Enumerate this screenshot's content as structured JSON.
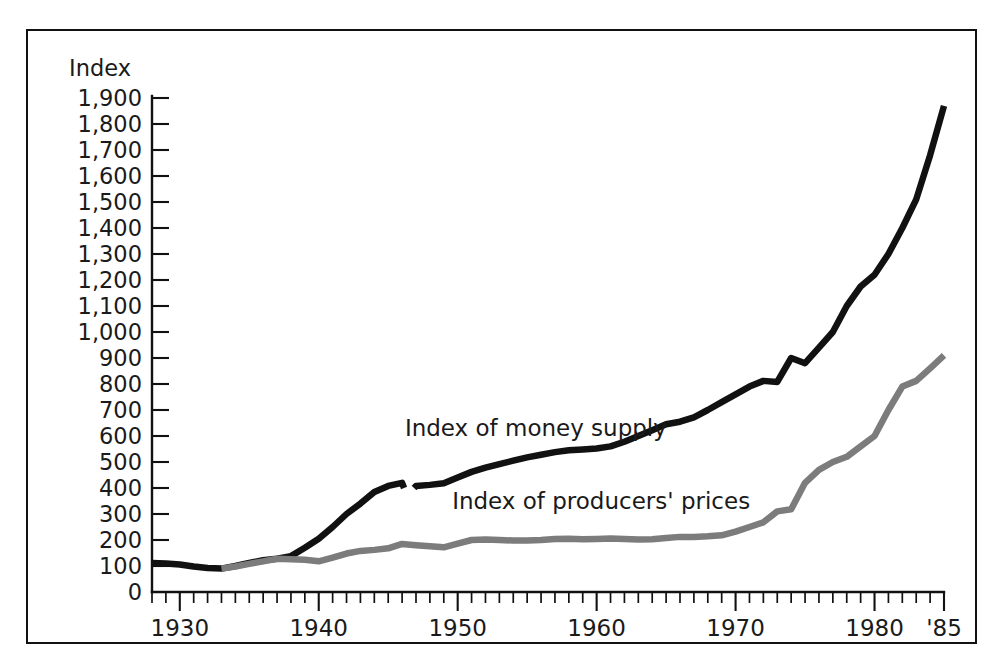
{
  "figure": {
    "name": "money-supply-vs-producers-prices-chart",
    "border_color": "#111111",
    "background": "#ffffff"
  },
  "chart_data": {
    "type": "line",
    "title": "",
    "subtitle": "",
    "xlabel": "",
    "ylabel": "Index",
    "ylim": [
      0,
      1900
    ],
    "xlim": [
      1928,
      1985
    ],
    "grid": false,
    "legend_position": "inline-annotation",
    "y_ticks": [
      0,
      100,
      200,
      300,
      400,
      500,
      600,
      700,
      800,
      900,
      1000,
      1100,
      1200,
      1300,
      1400,
      1500,
      1600,
      1700,
      1800,
      1900
    ],
    "y_tick_labels": [
      "0",
      "100",
      "200",
      "300",
      "400",
      "500",
      "600",
      "700",
      "800",
      "900",
      "1,000",
      "1,100",
      "1,200",
      "1,300",
      "1,400",
      "1,500",
      "1,600",
      "1,700",
      "1,800",
      "1,900"
    ],
    "x_major_ticks": [
      1930,
      1940,
      1950,
      1960,
      1970,
      1980,
      1985
    ],
    "x_major_tick_labels": [
      "1930",
      "1940",
      "1950",
      "1960",
      "1970",
      "1980",
      "'85"
    ],
    "x_minor_tick_step": 1,
    "annotations": [
      {
        "name": "money-supply-label",
        "text": "Index of money supply",
        "x": 1946.2,
        "y": 600
      },
      {
        "name": "producers-prices-label",
        "text": "Index of producers' prices",
        "x": 1949.6,
        "y": 320
      },
      {
        "name": "series-break-marker",
        "text": "",
        "x": 1946.5,
        "y": 420
      }
    ],
    "series": [
      {
        "name": "Index of money supply",
        "color": "#111111",
        "width": 6.5,
        "has_break_at": 1946.5,
        "x": [
          1928,
          1929,
          1930,
          1931,
          1932,
          1933,
          1934,
          1935,
          1936,
          1937,
          1938,
          1939,
          1940,
          1941,
          1942,
          1943,
          1944,
          1945,
          1946,
          1946.5,
          1947,
          1948,
          1949,
          1950,
          1951,
          1952,
          1953,
          1954,
          1955,
          1956,
          1957,
          1958,
          1959,
          1960,
          1961,
          1962,
          1963,
          1964,
          1965,
          1966,
          1967,
          1968,
          1969,
          1970,
          1971,
          1972,
          1973,
          1974,
          1975,
          1976,
          1977,
          1978,
          1979,
          1980,
          1981,
          1982,
          1983,
          1984,
          1985
        ],
        "y": [
          112,
          110,
          106,
          98,
          92,
          90,
          100,
          112,
          122,
          128,
          138,
          170,
          205,
          250,
          300,
          340,
          385,
          408,
          420,
          400,
          408,
          412,
          418,
          440,
          462,
          478,
          492,
          505,
          518,
          528,
          538,
          545,
          548,
          552,
          560,
          578,
          600,
          622,
          645,
          655,
          672,
          700,
          730,
          760,
          790,
          812,
          808,
          900,
          880,
          940,
          1000,
          1100,
          1175,
          1220,
          1300,
          1400,
          1510,
          1680,
          1870
        ]
      },
      {
        "name": "Index of producers' prices",
        "color": "#7c7c7c",
        "width": 6.5,
        "has_break_at": null,
        "x": [
          1933,
          1934,
          1935,
          1936,
          1937,
          1938,
          1939,
          1940,
          1941,
          1942,
          1943,
          1944,
          1945,
          1946,
          1947,
          1948,
          1949,
          1950,
          1951,
          1952,
          1953,
          1954,
          1955,
          1956,
          1957,
          1958,
          1959,
          1960,
          1961,
          1962,
          1963,
          1964,
          1965,
          1966,
          1967,
          1968,
          1969,
          1970,
          1971,
          1972,
          1973,
          1974,
          1975,
          1976,
          1977,
          1978,
          1979,
          1980,
          1981,
          1982,
          1983,
          1984,
          1985
        ],
        "y": [
          90,
          98,
          108,
          118,
          128,
          126,
          124,
          118,
          132,
          148,
          158,
          162,
          168,
          185,
          180,
          176,
          172,
          186,
          200,
          202,
          200,
          198,
          198,
          200,
          204,
          205,
          203,
          204,
          206,
          204,
          202,
          203,
          208,
          212,
          212,
          214,
          218,
          232,
          250,
          268,
          310,
          318,
          420,
          470,
          500,
          520,
          560,
          600,
          700,
          790,
          812,
          860,
          910
        ]
      }
    ]
  }
}
